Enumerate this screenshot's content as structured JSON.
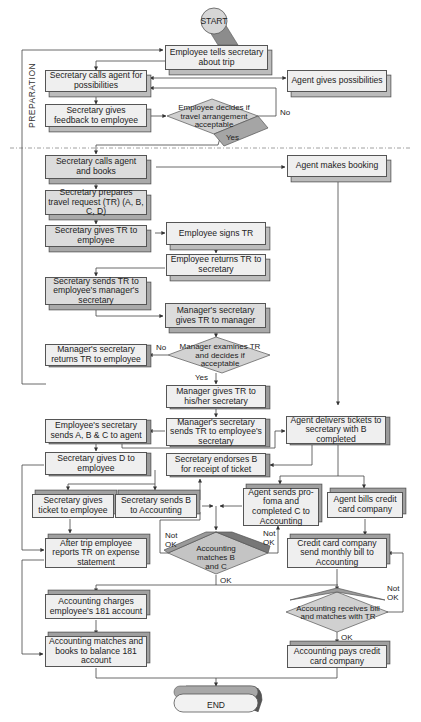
{
  "diagram": {
    "type": "flowchart",
    "colors": {
      "box_light": "#f0f0f0",
      "box_medium": "#d9d9d9",
      "box_side": "#bdbdbd",
      "decision": "#c8c8c8",
      "line": "#444444",
      "divider": "#888888"
    },
    "phase_label": "PREPARATION",
    "terminals": {
      "start": "START",
      "end": "END"
    },
    "nodes": [
      {
        "id": "n1",
        "text": "Employee tells secretary  about trip",
        "lines": [
          "Employee tells",
          "secretary  about trip"
        ]
      },
      {
        "id": "n2",
        "text": "Secretary calls agent for possibilities",
        "lines": [
          "Secretary calls",
          "agent for possibilities"
        ]
      },
      {
        "id": "n3",
        "text": "Agent gives possibilities",
        "lines": [
          "Agent gives",
          "possibilities"
        ]
      },
      {
        "id": "n4",
        "text": "Secretary gives feedback to employee",
        "lines": [
          "Secretary gives",
          "feedback to employee"
        ]
      },
      {
        "id": "d1",
        "text": "Employee decides if travel arrangement acceptable",
        "lines": [
          "Employee  decides",
          "if  travel  arrangement",
          "acceptable"
        ],
        "type": "decision"
      },
      {
        "id": "n5",
        "text": "Secretary calls agent and books",
        "lines": [
          "Secretary calls",
          "agent and books"
        ]
      },
      {
        "id": "n6",
        "text": "Agent makes booking",
        "lines": [
          "Agent makes",
          "booking"
        ]
      },
      {
        "id": "n7",
        "text": "Secretary prepares travel request (TR) (A, B, C, D)",
        "lines": [
          "Secretary prepares travel",
          "request (TR) (A, B, C, D)"
        ]
      },
      {
        "id": "n8",
        "text": "Secretary gives TR to employee",
        "lines": [
          "Secretary gives TR",
          "to employee"
        ]
      },
      {
        "id": "n9",
        "text": "Employee signs TR",
        "lines": [
          "Employee",
          "signs TR"
        ]
      },
      {
        "id": "n10",
        "text": "Employee returns TR to secretary",
        "lines": [
          "Employee returns TR",
          "to secretary"
        ]
      },
      {
        "id": "n11",
        "text": "Secretary sends TR to employee's manager's secretary",
        "lines": [
          "Secretary sends",
          "TR to employee's",
          "manager's secretary"
        ]
      },
      {
        "id": "n12",
        "text": "Manager's secretary gives TR to manager",
        "lines": [
          "Manager's secretary",
          "gives TR to manager"
        ]
      },
      {
        "id": "n13",
        "text": "Manager's secretary returns TR to employee",
        "lines": [
          "Manager's secretary",
          "returns TR to employee"
        ]
      },
      {
        "id": "d2",
        "text": "Manager examines TR and decides if acceptable",
        "lines": [
          "Manager  examines",
          "TR  and  decides  if",
          "acceptable"
        ],
        "type": "decision"
      },
      {
        "id": "n14",
        "text": "Manager gives TR to his/her secretary",
        "lines": [
          "Manager gives TR to",
          "his/her secretary"
        ]
      },
      {
        "id": "n15",
        "text": "Employee's secretary sends A, B & C to agent",
        "lines": [
          "Employee's secretary",
          "sends A, B & C to agent"
        ]
      },
      {
        "id": "n16",
        "text": "Manager's secretary sends TR to employee's secretary",
        "lines": [
          "Manager's secretary",
          "sends TR to",
          "employee's secretary"
        ]
      },
      {
        "id": "n17",
        "text": "Agent delivers tickets to secretary with B completed",
        "lines": [
          "Agent delivers",
          "tickets to secretary",
          "with B completed"
        ]
      },
      {
        "id": "n18",
        "text": "Secretary gives D to employee",
        "lines": [
          "Secretary gives",
          "D to employee"
        ]
      },
      {
        "id": "n19",
        "text": "Secretary endorses B for receipt of ticket",
        "lines": [
          "Secretary endorses B",
          "for receipt of ticket"
        ]
      },
      {
        "id": "n20",
        "text": "Secretary gives ticket to employee",
        "lines": [
          "Secretary gives",
          "ticket to employee"
        ]
      },
      {
        "id": "n21",
        "text": "Secretary sends B to Accounting",
        "lines": [
          "Secretary sends",
          "B to Accounting"
        ]
      },
      {
        "id": "n22",
        "text": "Agent sends pro-foma and completed C to Accounting",
        "lines": [
          "Agent sends",
          "pro-foma and",
          "completed C",
          "to Accounting"
        ]
      },
      {
        "id": "n23",
        "text": "Agent bills credit card company",
        "lines": [
          "Agent bills credit",
          "card company"
        ]
      },
      {
        "id": "n24",
        "text": "After trip employee reports TR on expense statement",
        "lines": [
          "After trip employee",
          "reports TR on expense",
          "statement"
        ]
      },
      {
        "id": "d3",
        "text": "Accounting matches B and C",
        "lines": [
          "Accounting",
          "matches B",
          "and C"
        ],
        "type": "decision"
      },
      {
        "id": "n25",
        "text": "Credit card company send monthly bill to Accounting",
        "lines": [
          "Credit card company",
          "send monthly bill to",
          "Accounting"
        ]
      },
      {
        "id": "n26",
        "text": "Accounting charges employee's 181 account",
        "lines": [
          "Accounting charges",
          "employee's 181 account"
        ]
      },
      {
        "id": "d4",
        "text": "Accounting receives bill and matches with TR",
        "lines": [
          "Accounting  receives",
          "bill  and  matches",
          "with  TR"
        ],
        "type": "decision"
      },
      {
        "id": "n27",
        "text": "Accounting matches and books to balance 181 account",
        "lines": [
          "Accounting matches",
          "and books to balance",
          "181 account"
        ]
      },
      {
        "id": "n28",
        "text": "Accounting pays credit card company",
        "lines": [
          "Accounting pays",
          "credit card company"
        ]
      }
    ],
    "edge_labels": {
      "d1_no": "No",
      "d1_yes": "Yes",
      "d2_no": "No",
      "d2_yes": "Yes",
      "d3_not_ok_left": "Not\nOK",
      "d3_not_ok_right": "Not\nOK",
      "d3_ok": "OK",
      "d4_not_ok": "Not\nOK",
      "d4_ok": "OK"
    },
    "edges": [
      [
        "start",
        "n1"
      ],
      [
        "n1",
        "n2"
      ],
      [
        "n2",
        "n3"
      ],
      [
        "n3",
        "n2"
      ],
      [
        "n2",
        "n4"
      ],
      [
        "n4",
        "d1"
      ],
      [
        "d1",
        "n2",
        "No"
      ],
      [
        "d1",
        "n5",
        "Yes"
      ],
      [
        "n5",
        "n6"
      ],
      [
        "n5",
        "n7"
      ],
      [
        "n7",
        "n8"
      ],
      [
        "n8",
        "n9"
      ],
      [
        "n9",
        "n10"
      ],
      [
        "n10",
        "n11"
      ],
      [
        "n11",
        "n12"
      ],
      [
        "n12",
        "d2"
      ],
      [
        "d2",
        "n13",
        "No"
      ],
      [
        "n13",
        "n1"
      ],
      [
        "d2",
        "n14",
        "Yes"
      ],
      [
        "n14",
        "n16"
      ],
      [
        "n16",
        "n15"
      ],
      [
        "n15",
        "n17"
      ],
      [
        "n6",
        "n17"
      ],
      [
        "n17",
        "n19"
      ],
      [
        "n15",
        "n18"
      ],
      [
        "n18",
        "n20"
      ],
      [
        "n18",
        "n21"
      ],
      [
        "n18",
        "n24"
      ],
      [
        "n21",
        "n19"
      ],
      [
        "n17",
        "n22"
      ],
      [
        "n17",
        "n23"
      ],
      [
        "n21",
        "d3"
      ],
      [
        "n22",
        "d3"
      ],
      [
        "d3",
        "n21",
        "Not OK"
      ],
      [
        "d3",
        "n22",
        "Not OK"
      ],
      [
        "d3",
        "n26",
        "OK"
      ],
      [
        "n20",
        "n24"
      ],
      [
        "n24",
        "n27"
      ],
      [
        "n26",
        "n27"
      ],
      [
        "n23",
        "n25"
      ],
      [
        "n25",
        "d4"
      ],
      [
        "d4",
        "n25",
        "Not OK"
      ],
      [
        "d4",
        "n28",
        "OK"
      ],
      [
        "n27",
        "end"
      ],
      [
        "n28",
        "end"
      ]
    ]
  }
}
